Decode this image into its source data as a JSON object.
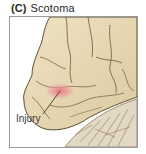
{
  "figure": {
    "panel_letter": "(C)",
    "panel_title": "Scotoma",
    "illustration": "brain-lateral-view-occipital-lobe",
    "callouts": [
      {
        "label": "Injury",
        "target": "occipital-lobe-lesion"
      }
    ],
    "colors": {
      "brain_tissue": "#e6d8b4",
      "brain_shadow": "#c9b68c",
      "sulci_lines": "#6b5a3a",
      "cerebellum": "#ddd2bc",
      "injury_highlight": "#e8808a",
      "frame_border": "#9a9a9a"
    }
  }
}
